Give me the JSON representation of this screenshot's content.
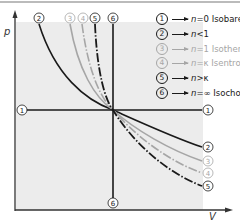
{
  "axes": {
    "y_label": "p",
    "x_label": "V"
  },
  "colors": {
    "dark": "#1a1a1a",
    "light": "#a6a6a6",
    "shade": "#ececec",
    "border": "#bbbbbb"
  },
  "curve_markers": {
    "top": [
      "2",
      "3",
      "4",
      "5",
      "6"
    ],
    "right": [
      "1",
      "2",
      "3",
      "4",
      "5"
    ],
    "left": "1",
    "bottom": "6"
  },
  "legend": [
    {
      "num": "1",
      "n": "n",
      "rel": "=0",
      "name": "Isobare",
      "color": "#1a1a1a"
    },
    {
      "num": "2",
      "n": "n",
      "rel": "<1",
      "name": "",
      "color": "#1a1a1a"
    },
    {
      "num": "3",
      "n": "n",
      "rel": "=1",
      "name": "Isotherme",
      "color": "#a6a6a6"
    },
    {
      "num": "4",
      "n": "n",
      "rel": "=κ",
      "name": "Isentrope",
      "color": "#a6a6a6"
    },
    {
      "num": "5",
      "n": "n",
      "rel": ">κ",
      "name": "",
      "color": "#1a1a1a"
    },
    {
      "num": "6",
      "n": "n",
      "rel": "=∞",
      "name": "Isochore",
      "color": "#1a1a1a"
    }
  ]
}
